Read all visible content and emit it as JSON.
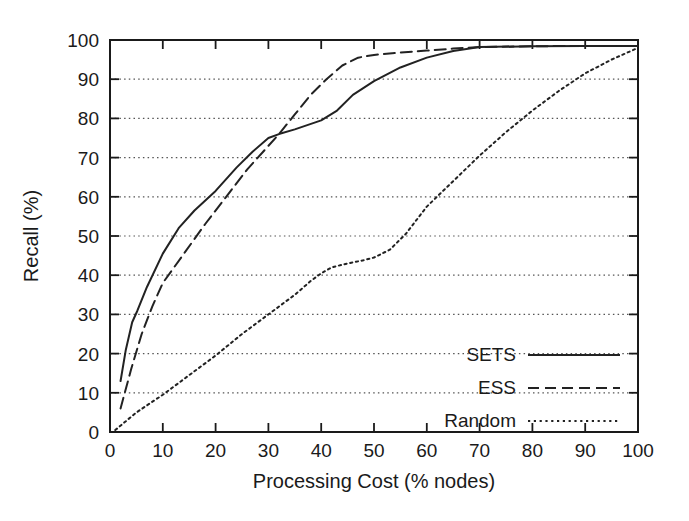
{
  "chart_data": {
    "type": "line",
    "title": "",
    "xlabel": "Processing Cost (% nodes)",
    "ylabel": "Recall (%)",
    "xlim": [
      0,
      100
    ],
    "ylim": [
      0,
      100
    ],
    "xticks": [
      0,
      10,
      20,
      30,
      40,
      50,
      60,
      70,
      80,
      90,
      100
    ],
    "yticks": [
      0,
      10,
      20,
      30,
      40,
      50,
      60,
      70,
      80,
      90,
      100
    ],
    "xtick_labels": [
      "0",
      "10",
      "20",
      "30",
      "40",
      "50",
      "60",
      "70",
      "80",
      "90",
      "100"
    ],
    "ytick_labels": [
      "0",
      "10",
      "20",
      "30",
      "40",
      "50",
      "60",
      "70",
      "80",
      "90",
      "100"
    ],
    "grid": "horizontal-dotted",
    "legend_position": "lower-right-inside",
    "series": [
      {
        "name": "SETS",
        "style": "solid",
        "color": "#222222",
        "points": [
          [
            2.0,
            13.0
          ],
          [
            3.0,
            21.0
          ],
          [
            4.2,
            28.0
          ],
          [
            5.2,
            31.0
          ],
          [
            7.0,
            37.0
          ],
          [
            10.0,
            45.5
          ],
          [
            13.0,
            52.0
          ],
          [
            16.0,
            56.5
          ],
          [
            20.0,
            61.5
          ],
          [
            24.0,
            67.5
          ],
          [
            27.0,
            71.5
          ],
          [
            30.0,
            75.0
          ],
          [
            32.0,
            76.0
          ],
          [
            35.0,
            77.2
          ],
          [
            40.0,
            79.5
          ],
          [
            43.0,
            82.0
          ],
          [
            46.0,
            86.0
          ],
          [
            50.0,
            89.5
          ],
          [
            55.0,
            93.0
          ],
          [
            60.0,
            95.5
          ],
          [
            65.0,
            97.2
          ],
          [
            70.0,
            98.2
          ],
          [
            80.0,
            98.4
          ],
          [
            90.0,
            98.5
          ],
          [
            100.0,
            98.5
          ]
        ]
      },
      {
        "name": "ESS",
        "style": "dashed",
        "color": "#222222",
        "points": [
          [
            2.0,
            6.0
          ],
          [
            4.0,
            16.0
          ],
          [
            6.0,
            25.0
          ],
          [
            8.0,
            32.0
          ],
          [
            10.0,
            38.0
          ],
          [
            14.0,
            45.5
          ],
          [
            18.0,
            53.0
          ],
          [
            22.0,
            60.0
          ],
          [
            26.0,
            67.0
          ],
          [
            30.0,
            73.0
          ],
          [
            32.0,
            76.0
          ],
          [
            35.0,
            81.0
          ],
          [
            38.0,
            86.0
          ],
          [
            41.0,
            90.0
          ],
          [
            44.0,
            93.5
          ],
          [
            47.0,
            95.5
          ],
          [
            50.0,
            96.2
          ],
          [
            55.0,
            96.8
          ],
          [
            60.0,
            97.3
          ],
          [
            65.0,
            97.8
          ],
          [
            70.0,
            98.2
          ],
          [
            80.0,
            98.4
          ],
          [
            90.0,
            98.5
          ],
          [
            100.0,
            98.5
          ]
        ]
      },
      {
        "name": "Random",
        "style": "dotted",
        "color": "#222222",
        "points": [
          [
            1.0,
            0.5
          ],
          [
            5.0,
            5.0
          ],
          [
            10.0,
            9.5
          ],
          [
            15.0,
            14.5
          ],
          [
            20.0,
            19.5
          ],
          [
            25.0,
            25.0
          ],
          [
            30.0,
            30.0
          ],
          [
            35.0,
            35.0
          ],
          [
            38.0,
            38.5
          ],
          [
            40.0,
            40.5
          ],
          [
            42.0,
            42.0
          ],
          [
            45.0,
            43.0
          ],
          [
            48.0,
            43.8
          ],
          [
            50.0,
            44.5
          ],
          [
            53.0,
            46.5
          ],
          [
            56.0,
            50.5
          ],
          [
            60.0,
            57.5
          ],
          [
            65.0,
            64.0
          ],
          [
            70.0,
            70.5
          ],
          [
            75.0,
            76.5
          ],
          [
            80.0,
            82.0
          ],
          [
            85.0,
            87.0
          ],
          [
            90.0,
            91.5
          ],
          [
            95.0,
            95.0
          ],
          [
            100.0,
            98.0
          ]
        ]
      }
    ],
    "legend": [
      {
        "label": "SETS",
        "style": "solid"
      },
      {
        "label": "ESS",
        "style": "dashed"
      },
      {
        "label": "Random",
        "style": "dotted"
      }
    ]
  }
}
